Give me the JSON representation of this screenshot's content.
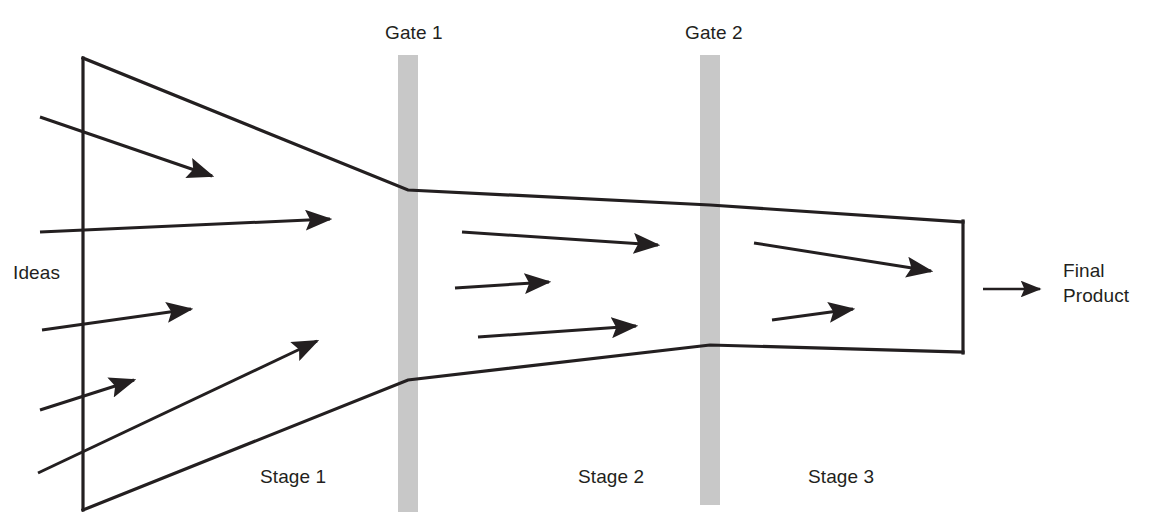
{
  "diagram": {
    "type": "stage-gate-funnel",
    "background_color": "#ffffff",
    "line_color": "#231f20",
    "gate_color": "#c8c8c8",
    "labels": {
      "gate_1": "Gate 1",
      "gate_2": "Gate 2",
      "ideas": "Ideas",
      "final_product": "Final\nProduct",
      "stage_1": "Stage 1",
      "stage_2": "Stage 2",
      "stage_3": "Stage 3"
    },
    "funnel": {
      "left_edge": {
        "x": 83,
        "y_top": 58,
        "y_bottom": 510
      },
      "gate_1_x": 408,
      "gate_2_x": 710,
      "right_edge": {
        "x": 963,
        "y_top": 222,
        "y_bottom": 352
      },
      "top_edge_points": [
        [
          83,
          58
        ],
        [
          408,
          190
        ],
        [
          710,
          205
        ],
        [
          963,
          222
        ]
      ],
      "bottom_edge_points": [
        [
          83,
          510
        ],
        [
          408,
          380
        ],
        [
          710,
          345
        ],
        [
          963,
          352
        ]
      ]
    },
    "gates": [
      {
        "name": "Gate 1",
        "x": 398,
        "y": 55,
        "width": 20,
        "height": 457
      },
      {
        "name": "Gate 2",
        "x": 700,
        "y": 55,
        "width": 20,
        "height": 450
      }
    ],
    "idea_arrows": [
      {
        "x1": 40,
        "y1": 117,
        "x2": 218,
        "y2": 178
      },
      {
        "x1": 40,
        "y1": 232,
        "x2": 337,
        "y2": 218
      },
      {
        "x1": 42,
        "y1": 330,
        "x2": 197,
        "y2": 307
      },
      {
        "x1": 40,
        "y1": 410,
        "x2": 140,
        "y2": 378
      },
      {
        "x1": 38,
        "y1": 473,
        "x2": 323,
        "y2": 338
      }
    ],
    "stage_2_arrows": [
      {
        "x1": 462,
        "y1": 232,
        "x2": 665,
        "y2": 246
      },
      {
        "x1": 455,
        "y1": 288,
        "x2": 556,
        "y2": 281
      },
      {
        "x1": 478,
        "y1": 337,
        "x2": 643,
        "y2": 325
      }
    ],
    "stage_3_arrows": [
      {
        "x1": 754,
        "y1": 243,
        "x2": 938,
        "y2": 272
      },
      {
        "x1": 772,
        "y1": 320,
        "x2": 860,
        "y2": 308
      }
    ],
    "output_arrow": {
      "x1": 983,
      "y1": 289,
      "x2": 1045,
      "y2": 289
    }
  }
}
